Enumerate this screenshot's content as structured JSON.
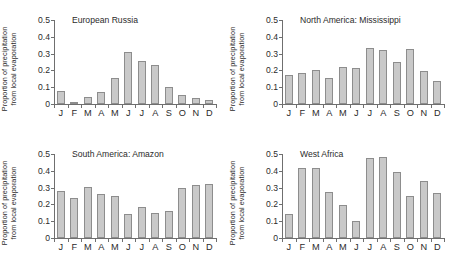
{
  "chart_data": [
    {
      "type": "bar",
      "title": "European Russia",
      "xlabel": "",
      "ylabel": "Proportion of precipitation\nfrom local evaporation",
      "ylim": [
        0,
        0.5
      ],
      "yticks": [
        0,
        0.1,
        0.2,
        0.3,
        0.4,
        0.5
      ],
      "ytick_labels": [
        "0",
        "0.1",
        "0.2",
        "0.3",
        "0.4",
        "0.5"
      ],
      "grid": false,
      "legend": "none",
      "categories": [
        "J",
        "F",
        "M",
        "A",
        "M",
        "J",
        "J",
        "A",
        "S",
        "O",
        "N",
        "D"
      ],
      "values": [
        0.075,
        0.003,
        0.043,
        0.072,
        0.155,
        0.312,
        0.258,
        0.232,
        0.101,
        0.054,
        0.037,
        0.025
      ]
    },
    {
      "type": "bar",
      "title": "North America: Mississippi",
      "xlabel": "",
      "ylabel": "Proportion of precipitation\nfrom local evaporation",
      "ylim": [
        0,
        0.5
      ],
      "yticks": [
        0,
        0.1,
        0.2,
        0.3,
        0.4,
        0.5
      ],
      "ytick_labels": [
        "0",
        "0.1",
        "0.2",
        "0.3",
        "0.4",
        "0.5"
      ],
      "grid": false,
      "legend": "none",
      "categories": [
        "J",
        "F",
        "M",
        "A",
        "M",
        "J",
        "J",
        "A",
        "S",
        "O",
        "N",
        "D"
      ],
      "values": [
        0.175,
        0.185,
        0.204,
        0.155,
        0.222,
        0.216,
        0.331,
        0.323,
        0.252,
        0.329,
        0.199,
        0.139
      ]
    },
    {
      "type": "bar",
      "title": "South America: Amazon",
      "xlabel": "",
      "ylabel": "Proportion of precipitation\nfrom local evaporation",
      "ylim": [
        0,
        0.5
      ],
      "yticks": [
        0,
        0.1,
        0.2,
        0.3,
        0.4,
        0.5
      ],
      "ytick_labels": [
        "0",
        "0.1",
        "0.2",
        "0.3",
        "0.4",
        "0.5"
      ],
      "grid": false,
      "legend": "none",
      "categories": [
        "J",
        "F",
        "M",
        "A",
        "M",
        "J",
        "J",
        "A",
        "S",
        "O",
        "N",
        "D"
      ],
      "values": [
        0.277,
        0.236,
        0.302,
        0.264,
        0.249,
        0.144,
        0.183,
        0.151,
        0.159,
        0.296,
        0.315,
        0.322
      ]
    },
    {
      "type": "bar",
      "title": "West Africa",
      "xlabel": "",
      "ylabel": "Proportion of precipitation\nfrom local evaporation",
      "ylim": [
        0,
        0.5
      ],
      "yticks": [
        0,
        0.1,
        0.2,
        0.3,
        0.4,
        0.5
      ],
      "ytick_labels": [
        "0",
        "0.1",
        "0.2",
        "0.3",
        "0.4",
        "0.5"
      ],
      "grid": false,
      "legend": "none",
      "categories": [
        "J",
        "F",
        "M",
        "A",
        "M",
        "J",
        "J",
        "A",
        "S",
        "O",
        "N",
        "D"
      ],
      "values": [
        0.141,
        0.419,
        0.419,
        0.276,
        0.197,
        0.099,
        0.475,
        0.484,
        0.391,
        0.249,
        0.339,
        0.265
      ]
    }
  ],
  "style": {
    "bar_fill": "#c9c9c9",
    "bar_edge": "#8d8d8d",
    "axis_color": "#6f6f6f",
    "text_color": "#2b2b2b",
    "background": "#ffffff"
  }
}
